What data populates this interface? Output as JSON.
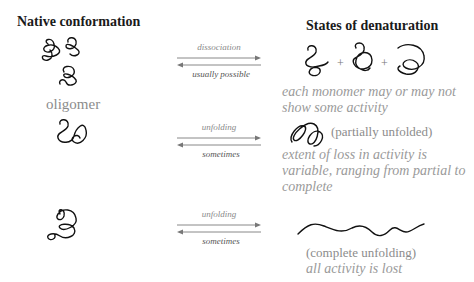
{
  "headers": {
    "left": "Native conformation",
    "right": "States of denaturation"
  },
  "rows": [
    {
      "left_label": "oligomer",
      "arrow_top": "dissociation",
      "arrow_bottom": "usually possible",
      "plus": "+",
      "note": [
        "each monomer may or may not",
        "show some activity"
      ]
    },
    {
      "arrow_top": "unfolding",
      "arrow_bottom": "sometimes",
      "state_label": "(partially unfolded)",
      "note": [
        "extent of loss in activity is",
        "variable, ranging from partial to",
        "complete"
      ]
    },
    {
      "arrow_top": "unfolding",
      "arrow_bottom": "sometimes",
      "state_label": "(complete unfolding)",
      "note": [
        "all activity is lost"
      ]
    }
  ],
  "icons": [
    "oligomer-coil-icon",
    "monomer-coil-icon",
    "partially-unfolded-coil-icon",
    "unfolded-chain-icon",
    "equilibrium-arrows-icon"
  ]
}
